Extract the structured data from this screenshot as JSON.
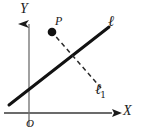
{
  "figure": {
    "type": "coordinate-geometry-diagram",
    "background_color": "#ffffff",
    "ink_color": "#1a1a1a",
    "axis_color": "#6b6b6b",
    "width": 141,
    "height": 136,
    "labels": {
      "y_axis": "Y",
      "x_axis": "X",
      "origin": "O",
      "point_p": "P",
      "line_main": "ℓ",
      "line_perpendicular": "ℓ",
      "line_perpendicular_subscript": "1"
    },
    "elements": {
      "x_axis": {
        "name": "x-axis",
        "from": [
          4,
          113
        ],
        "to": [
          120,
          113
        ],
        "arrow": "right"
      },
      "y_axis": {
        "name": "y-axis",
        "from": [
          29,
          126
        ],
        "to": [
          29,
          12
        ],
        "arrow": "up"
      },
      "line_l": {
        "name": "line-l",
        "style": "solid",
        "from": [
          9,
          105
        ],
        "to": [
          109,
          27
        ]
      },
      "line_l1": {
        "name": "line-l1",
        "style": "dashed",
        "from": [
          51,
          31
        ],
        "to": [
          101,
          88
        ]
      },
      "point_p": {
        "name": "point-p",
        "center": [
          52,
          32
        ],
        "radius": 4.2,
        "filled": true
      }
    }
  }
}
